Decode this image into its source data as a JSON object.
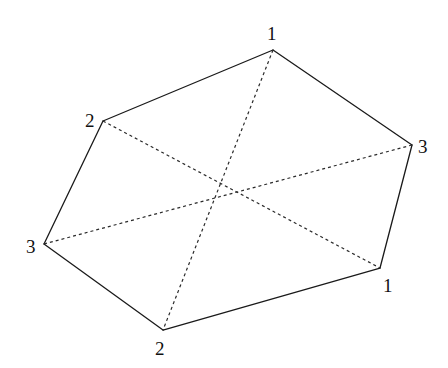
{
  "diagram": {
    "type": "hexagon-with-diagonals",
    "colors": {
      "stroke": "#1a1a1a",
      "background": "#ffffff"
    },
    "vertices": [
      {
        "id": "v_top",
        "label": "1",
        "x": 273,
        "y": 50,
        "lx": 267,
        "ly": 40
      },
      {
        "id": "v_right",
        "label": "3",
        "x": 412,
        "y": 145,
        "lx": 418,
        "ly": 153
      },
      {
        "id": "v_bottomright",
        "label": "1",
        "x": 380,
        "y": 268,
        "lx": 383,
        "ly": 292
      },
      {
        "id": "v_bottom",
        "label": "2",
        "x": 163,
        "y": 330,
        "lx": 155,
        "ly": 355
      },
      {
        "id": "v_left",
        "label": "3",
        "x": 44,
        "y": 244,
        "lx": 26,
        "ly": 253
      },
      {
        "id": "v_upperleft",
        "label": "2",
        "x": 103,
        "y": 121,
        "lx": 85,
        "ly": 127
      }
    ],
    "edges": [
      [
        "v_top",
        "v_right"
      ],
      [
        "v_right",
        "v_bottomright"
      ],
      [
        "v_bottomright",
        "v_bottom"
      ],
      [
        "v_bottom",
        "v_left"
      ],
      [
        "v_left",
        "v_upperleft"
      ],
      [
        "v_upperleft",
        "v_top"
      ]
    ],
    "diagonals": [
      [
        "v_top",
        "v_bottom"
      ],
      [
        "v_upperleft",
        "v_bottomright"
      ],
      [
        "v_right",
        "v_left"
      ]
    ]
  }
}
